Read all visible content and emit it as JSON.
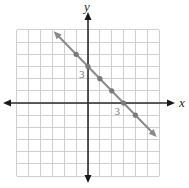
{
  "chart_data": {
    "type": "line",
    "title": "",
    "xlabel": "x",
    "ylabel": "y",
    "xlim": [
      -6,
      6
    ],
    "ylim": [
      -6,
      6
    ],
    "grid": true,
    "equation": "y = -x + 3",
    "series": [
      {
        "name": "line",
        "x": [
          -1,
          0,
          1,
          2,
          3,
          4
        ],
        "y": [
          4,
          3,
          2,
          1,
          0,
          -1
        ],
        "line_extent": {
          "start": [
            -2.9,
            5.9
          ],
          "end": [
            5.8,
            -2.8
          ]
        },
        "color": "#8a8a8a"
      }
    ],
    "annotations": [
      {
        "text": "3",
        "at": [
          0,
          3
        ],
        "position": "below-left"
      },
      {
        "text": "3",
        "at": [
          3,
          0
        ],
        "position": "below-left"
      }
    ],
    "legend": null
  },
  "layout": {
    "origin_px": [
      88,
      103
    ],
    "cell_w": 11.85,
    "cell_h": 12.17,
    "grid_min": -6,
    "grid_max": 6,
    "x_axis_extent_px": [
      3,
      175
    ],
    "y_axis_extent_px": [
      12,
      183
    ]
  },
  "colors": {
    "grid": "#cfcfcf",
    "axis": "#2a2a2a",
    "line": "#8a8a8a",
    "point": "#7a7a7a",
    "tick_label": "#777777"
  }
}
